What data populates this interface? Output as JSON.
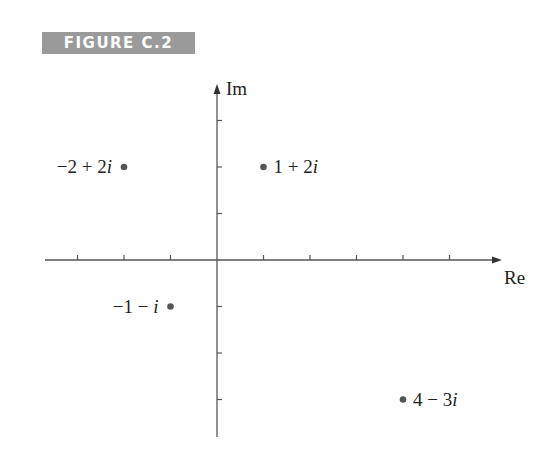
{
  "figure_label": "FIGURE C.2",
  "axes": {
    "x_label": "Re",
    "y_label": "Im",
    "origin_px": [
      217,
      260
    ],
    "unit_px": 46.5,
    "x_ticks": [
      -3,
      -2,
      -1,
      1,
      2,
      3,
      4,
      5
    ],
    "y_ticks": [
      -3,
      -2,
      -1,
      1,
      2,
      3
    ],
    "x_range": [
      -3.7,
      6.1
    ],
    "y_range": [
      -3.8,
      3.8
    ]
  },
  "points": [
    {
      "re": -2,
      "im": 2,
      "label": "−2 + 2i",
      "label_parts": [
        "−2 + 2",
        "i"
      ],
      "label_side": "left"
    },
    {
      "re": 1,
      "im": 2,
      "label": "1 + 2i",
      "label_parts": [
        "1 + 2",
        "i"
      ],
      "label_side": "right"
    },
    {
      "re": -1,
      "im": -1,
      "label": "−1 − i",
      "label_parts": [
        "−1 − ",
        "i"
      ],
      "label_side": "left"
    },
    {
      "re": 4,
      "im": -3,
      "label": "4 − 3i",
      "label_parts": [
        "4 − 3",
        "i"
      ],
      "label_side": "right"
    }
  ],
  "colors": {
    "axis": "#555555",
    "point": "#555555",
    "label_bg": "#9a9a9a"
  }
}
